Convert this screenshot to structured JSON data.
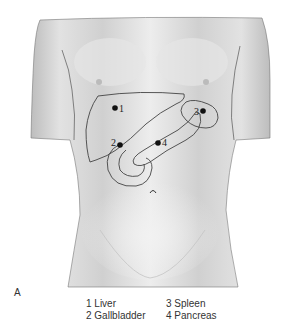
{
  "figure": {
    "panel_label": "A",
    "markers": [
      {
        "number": "1",
        "label": "Liver"
      },
      {
        "number": "2",
        "label": "Gallbladder"
      },
      {
        "number": "3",
        "label": "Spleen"
      },
      {
        "number": "4",
        "label": "Pancreas"
      }
    ],
    "legend": {
      "col1": [
        "1  Liver",
        "2  Gallbladder"
      ],
      "col2": [
        "3  Spleen",
        "4  Pancreas"
      ]
    },
    "colors": {
      "skin_light": "#ececec",
      "skin_mid": "#d4d4d4",
      "outline": "#444444",
      "marker": "#111111"
    }
  }
}
